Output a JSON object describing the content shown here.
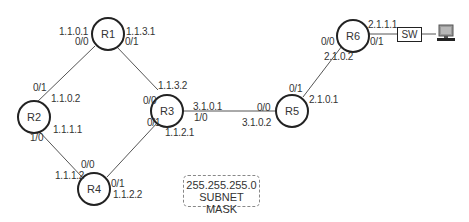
{
  "routers": {
    "r1": {
      "label": "R1"
    },
    "r2": {
      "label": "R2"
    },
    "r3": {
      "label": "R3"
    },
    "r4": {
      "label": "R4"
    },
    "r5": {
      "label": "R5"
    },
    "r6": {
      "label": "R6"
    }
  },
  "switch": {
    "label": "SW"
  },
  "pc": {
    "icon": "computer-icon"
  },
  "interfaces": {
    "r1_left_ip": "1.1.0.1",
    "r1_left_port": "0/0",
    "r1_right_ip": "1.1.3.1",
    "r1_right_port": "0/1",
    "r2_top_port": "0/1",
    "r2_top_ip": "1.1.0.2",
    "r2_bottom_ip": "1.1.1.1",
    "r2_bottom_port": "1/0",
    "r3_top_ip": "1.1.3.2",
    "r3_top_port": "0/0",
    "r3_right_ip": "3.1.0.1",
    "r3_right_port": "1/0",
    "r3_bottom_port": "0/1",
    "r3_bottom_ip": "1.1.2.1",
    "r4_top_port": "0/0",
    "r4_top_ip": "1.1.1.2",
    "r4_right_port": "0/1",
    "r4_right_ip": "1.1.2.2",
    "r5_left_port": "0/0",
    "r5_left_ip": "3.1.0.2",
    "r5_top_port": "0/1",
    "r5_top_ip": "2.1.0.1",
    "r6_left_port": "0/0",
    "r6_left_ip": "2.1.0.2",
    "r6_right_ip": "2.1.1.1",
    "r6_right_port": "0/1"
  },
  "subnet_mask": {
    "value": "255.255.255.0",
    "label": "SUBNET MASK"
  },
  "colors": {
    "node_border": "#222222",
    "link": "#555555",
    "text": "#333333"
  }
}
